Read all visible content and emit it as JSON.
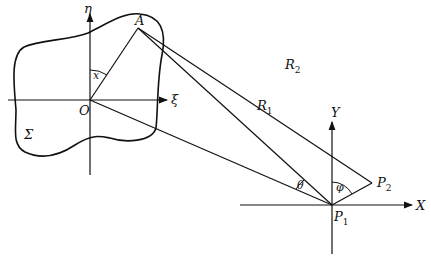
{
  "diagram": {
    "type": "geometry",
    "labels": {
      "eta": "η",
      "xi": "ξ",
      "A": "A",
      "O": "O",
      "x": "x",
      "Sigma": "Σ",
      "R1": "R",
      "R1_sub": "1",
      "R2": "R",
      "R2_sub": "2",
      "theta": "θ",
      "phi": "φ",
      "Y": "Y",
      "X": "X",
      "P1": "P",
      "P1_sub": "1",
      "P2": "P",
      "P2_sub": "2"
    },
    "points": {
      "O": [
        90,
        100
      ],
      "A": [
        138,
        28
      ],
      "P1": [
        332,
        205
      ],
      "P2": [
        372,
        183
      ]
    },
    "colors": {
      "stroke": "#111111",
      "background": "#ffffff"
    }
  }
}
